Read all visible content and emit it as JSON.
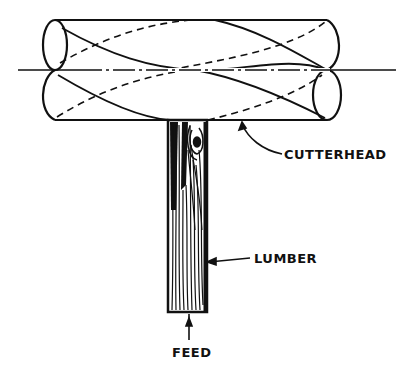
{
  "diagram": {
    "colors": {
      "ink": "#111111",
      "background": "#ffffff"
    },
    "labels": {
      "cutterhead": "CUTTERHEAD",
      "lumber": "LUMBER",
      "feed": "FEED"
    },
    "components": [
      {
        "id": "cutterhead",
        "shape": "cylinder with helical knives (solid and dashed spiral lines)"
      },
      {
        "id": "lumber",
        "shape": "wood board with grain and knot, fed beneath cutterhead"
      },
      {
        "id": "feed-arrow",
        "shape": "arrow pointing up into board"
      },
      {
        "id": "center-line",
        "shape": "dash-dot horizontal axis line"
      }
    ]
  }
}
